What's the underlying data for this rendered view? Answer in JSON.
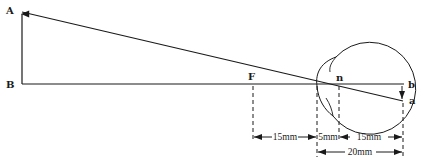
{
  "diagram": {
    "points": {
      "A": "A",
      "B": "B",
      "F": "F",
      "n": "n",
      "b": "b",
      "a": "a"
    },
    "dimensions": {
      "front_focal": "15mm",
      "cornea_to_nodal": "5mm",
      "nodal_to_retina": "15mm",
      "total": "20mm"
    },
    "colors": {
      "line": "#1a1a1a",
      "background": "#ffffff"
    }
  }
}
